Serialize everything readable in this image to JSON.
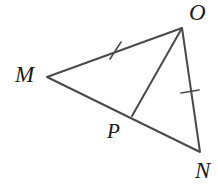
{
  "figure": {
    "kind": "geometry-diagram",
    "shape": "triangle-with-cevian",
    "background_color": "#ffffff",
    "stroke_color": "#4a4a4a",
    "label_color": "#1a1a1a",
    "stroke_width": 2,
    "tick_stroke_width": 1.6,
    "canvas": {
      "width": 218,
      "height": 188
    }
  },
  "labels": {
    "m": "M",
    "o": "O",
    "p": "P",
    "n": "N"
  },
  "points": {
    "M": {
      "x": 47,
      "y": 77
    },
    "O": {
      "x": 182,
      "y": 28
    },
    "N": {
      "x": 200,
      "y": 152
    },
    "P": {
      "x": 132,
      "y": 116
    }
  },
  "segments": [
    {
      "name": "MO",
      "from": "M",
      "to": "O",
      "tick_marks": 1
    },
    {
      "name": "MN",
      "from": "M",
      "to": "N",
      "tick_marks": 0
    },
    {
      "name": "ON",
      "from": "O",
      "to": "N",
      "tick_marks": 1
    },
    {
      "name": "OP",
      "from": "O",
      "to": "P",
      "tick_marks": 0
    }
  ],
  "tick_marks": [
    {
      "on_segment": "MO",
      "x1": 110,
      "y1": 59,
      "x2": 121,
      "y2": 42
    },
    {
      "on_segment": "ON",
      "x1": 181,
      "y1": 93,
      "x2": 199,
      "y2": 90
    }
  ],
  "geometry_paths": {
    "triangle": "M 47 77 L 182 28 L 200 152 Z",
    "cevian": "M 182 28 L 132 116"
  }
}
